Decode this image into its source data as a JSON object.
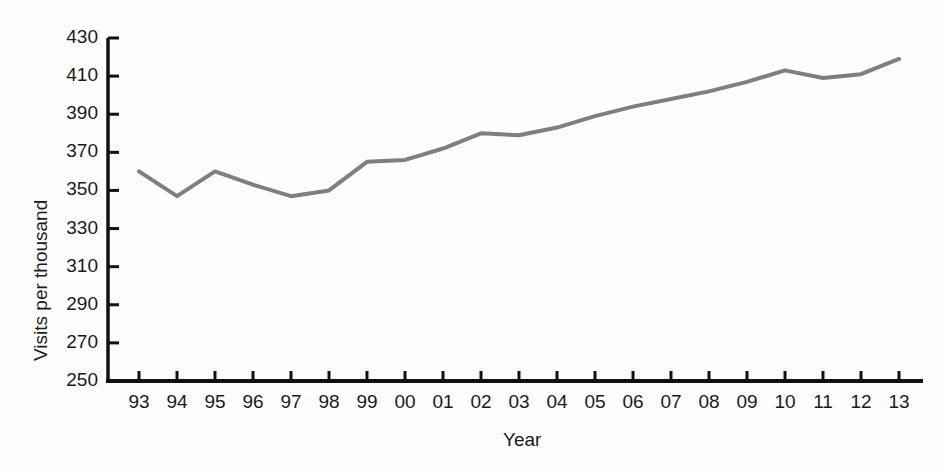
{
  "chart_data": {
    "type": "line",
    "title": "",
    "xlabel": "Year",
    "ylabel": "Visits per thousand",
    "x": [
      "93",
      "94",
      "95",
      "96",
      "97",
      "98",
      "99",
      "00",
      "01",
      "02",
      "03",
      "04",
      "05",
      "06",
      "07",
      "08",
      "09",
      "10",
      "11",
      "12",
      "13"
    ],
    "x_full_years": [
      1993,
      1994,
      1995,
      1996,
      1997,
      1998,
      1999,
      2000,
      2001,
      2002,
      2003,
      2004,
      2005,
      2006,
      2007,
      2008,
      2009,
      2010,
      2011,
      2012,
      2013
    ],
    "values": [
      360,
      347,
      360,
      353,
      347,
      350,
      365,
      366,
      372,
      380,
      379,
      383,
      389,
      394,
      398,
      402,
      407,
      413,
      409,
      411,
      419
    ],
    "xtick_labels": [
      "93",
      "94",
      "95",
      "96",
      "97",
      "98",
      "99",
      "00",
      "01",
      "02",
      "03",
      "04",
      "05",
      "06",
      "07",
      "08",
      "09",
      "10",
      "11",
      "12",
      "13"
    ],
    "ytick_labels": [
      "250",
      "270",
      "290",
      "310",
      "330",
      "350",
      "370",
      "390",
      "410",
      "430"
    ],
    "yticks": [
      250,
      270,
      290,
      310,
      330,
      350,
      370,
      390,
      410,
      430
    ],
    "ylim": [
      250,
      430
    ],
    "grid": false,
    "legend": null,
    "legend_position": "none",
    "line_color": "#7f7f7f",
    "axis_color": "#111111",
    "line_width": 4,
    "background_color": "#fdfdfd",
    "markers": false
  },
  "axes": {
    "y_title": "Visits per thousand",
    "x_title": "Year"
  }
}
